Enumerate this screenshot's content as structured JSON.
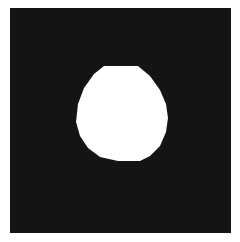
{
  "image": {
    "description": "Binary mask: white rounded blob on black square background",
    "background_color": "#141414",
    "foreground_color": "#ffffff",
    "page_color": "#ffffff"
  }
}
